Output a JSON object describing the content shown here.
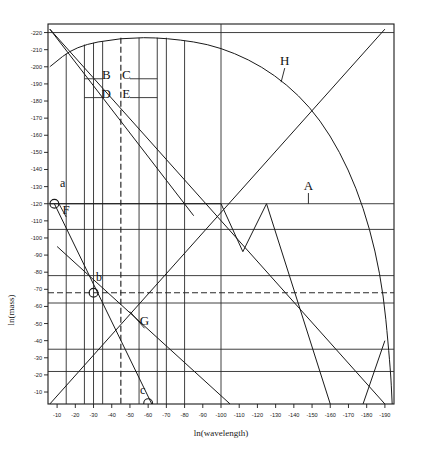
{
  "chart_data": {
    "type": "line",
    "title": "",
    "xlabel": "ln(wavelength)",
    "ylabel": "ln(mass)",
    "xlim": [
      -5,
      -195
    ],
    "ylim": [
      -3,
      -225
    ],
    "grid": false,
    "legend_position": "none",
    "x_ticks": [
      -10,
      -20,
      -30,
      -40,
      -50,
      -60,
      -70,
      -80,
      -90,
      -100,
      -110,
      -120,
      -130,
      -140,
      -150,
      -160,
      -170,
      -180,
      -190
    ],
    "x_tick_labels": [
      "-10",
      "-20",
      "-30",
      "-40",
      "-50",
      "-60",
      "-70",
      "-80",
      "-90",
      "-100",
      "-110",
      "-120",
      "-130",
      "-140",
      "-150",
      "-160",
      "-170",
      "-180",
      "-190"
    ],
    "y_ticks": [
      -220,
      -210,
      -200,
      -190,
      -180,
      -170,
      -160,
      -150,
      -140,
      -130,
      -120,
      -110,
      -100,
      -90,
      -80,
      -70,
      -60,
      -50,
      -40,
      -30,
      -20,
      -10
    ],
    "y_tick_labels": [
      "-220",
      "-210",
      "-200",
      "-190",
      "-180",
      "-170",
      "-160",
      "-150",
      "-140",
      "-130",
      "-120",
      "-110",
      "-100",
      "-90",
      "-80",
      "-70",
      "-60",
      "-50",
      "-40",
      "-30",
      "-20",
      "-10"
    ],
    "annotations": [
      {
        "id": "A",
        "label": "A",
        "x": -148,
        "y": -128,
        "leader_to_x": -148,
        "leader_to_y": -120,
        "kind": "line-callout"
      },
      {
        "id": "B",
        "label": "B",
        "x": -37,
        "y": -193,
        "kind": "region"
      },
      {
        "id": "C",
        "label": "C",
        "x": -48,
        "y": -193,
        "kind": "region"
      },
      {
        "id": "D",
        "label": "D",
        "x": -37,
        "y": -182,
        "kind": "region"
      },
      {
        "id": "E",
        "label": "E",
        "x": -48,
        "y": -182,
        "kind": "region"
      },
      {
        "id": "F",
        "label": "F",
        "x": -15,
        "y": -114,
        "leader_to_x": -11,
        "leader_to_y": -120,
        "kind": "line-callout"
      },
      {
        "id": "G",
        "label": "G",
        "x": -58,
        "y": -49,
        "leader_to_x": -50,
        "leader_to_y": -57,
        "kind": "line-callout"
      },
      {
        "id": "H",
        "label": "H",
        "x": -135,
        "y": -201,
        "leader_to_x": -133,
        "leader_to_y": -191,
        "kind": "line-callout"
      },
      {
        "id": "a",
        "label": "a",
        "x": -13,
        "y": -130,
        "kind": "point-label"
      },
      {
        "id": "b",
        "label": "b",
        "x": -33,
        "y": -75,
        "kind": "point-label"
      },
      {
        "id": "c",
        "label": "c",
        "x": -57,
        "y": -9,
        "kind": "point-label"
      }
    ],
    "markers": [
      {
        "id": "a",
        "x": -8.5,
        "y": -120,
        "shape": "circle"
      },
      {
        "id": "b",
        "x": -30,
        "y": -68,
        "shape": "circle"
      },
      {
        "id": "c",
        "x": -60,
        "y": -3.5,
        "shape": "circle"
      }
    ],
    "horizontal_lines": [
      {
        "y": -220,
        "style": "solid"
      },
      {
        "y": -120,
        "style": "solid"
      },
      {
        "y": -105,
        "style": "solid"
      },
      {
        "y": -78,
        "style": "solid"
      },
      {
        "y": -68,
        "style": "dashed"
      },
      {
        "y": -62,
        "style": "solid"
      },
      {
        "y": -35,
        "style": "solid"
      },
      {
        "y": -22,
        "style": "solid"
      }
    ],
    "vertical_lines": [
      {
        "x": -15,
        "style": "solid"
      },
      {
        "x": -25,
        "style": "solid"
      },
      {
        "x": -30,
        "style": "solid"
      },
      {
        "x": -35,
        "style": "solid"
      },
      {
        "x": -45,
        "style": "dashed"
      },
      {
        "x": -55,
        "style": "solid"
      },
      {
        "x": -65,
        "style": "solid"
      },
      {
        "x": -70,
        "style": "solid"
      },
      {
        "x": -80,
        "style": "solid"
      },
      {
        "x": -100,
        "style": "solid"
      }
    ],
    "series": [
      {
        "name": "arc-H",
        "type": "arc",
        "description": "large concave-down arc spanning the plot",
        "points": [
          [
            -6,
            -200
          ],
          [
            -20,
            -212
          ],
          [
            -45,
            -217
          ],
          [
            -70,
            -217
          ],
          [
            -100,
            -212
          ],
          [
            -130,
            -196
          ],
          [
            -155,
            -170
          ],
          [
            -175,
            -130
          ],
          [
            -188,
            -80
          ],
          [
            -193,
            -25
          ],
          [
            -194,
            -3
          ]
        ]
      },
      {
        "name": "descending-main",
        "type": "line",
        "points": [
          [
            -6,
            -222
          ],
          [
            -85,
            -113
          ]
        ]
      },
      {
        "name": "descending-long",
        "type": "line",
        "points": [
          [
            -6,
            -222
          ],
          [
            -190,
            -3
          ]
        ]
      },
      {
        "name": "rising-main",
        "type": "line",
        "points": [
          [
            -6,
            -3
          ],
          [
            -190,
            -222
          ]
        ]
      },
      {
        "name": "zigzag-V",
        "type": "line",
        "points": [
          [
            -6,
            -120
          ],
          [
            -100,
            -120
          ],
          [
            -112,
            -92
          ],
          [
            -125,
            -120
          ],
          [
            -160,
            -3
          ]
        ]
      },
      {
        "name": "F-descender",
        "type": "line",
        "points": [
          [
            -8.5,
            -120
          ],
          [
            -62,
            -3
          ]
        ]
      },
      {
        "name": "G-descender",
        "type": "line",
        "points": [
          [
            -10,
            -95
          ],
          [
            -105,
            -3
          ]
        ]
      },
      {
        "name": "bottom-right-V",
        "type": "line",
        "points": [
          [
            -178,
            -3
          ],
          [
            -190,
            -40
          ]
        ]
      }
    ]
  }
}
